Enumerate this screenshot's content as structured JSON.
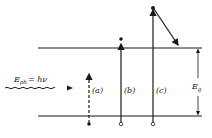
{
  "diagram": {
    "type": "band-diagram",
    "photon": {
      "label": "E",
      "subscript": "ph",
      "equation": "= hν"
    },
    "transitions": [
      {
        "id": "a",
        "label": "(a)"
      },
      {
        "id": "b",
        "label": "(b)"
      },
      {
        "id": "c",
        "label": "(c)"
      }
    ],
    "bandgap": {
      "label": "E",
      "subscript": "g"
    },
    "colors": {
      "ink": "#1a1a1a",
      "background": "#ffffff"
    }
  }
}
